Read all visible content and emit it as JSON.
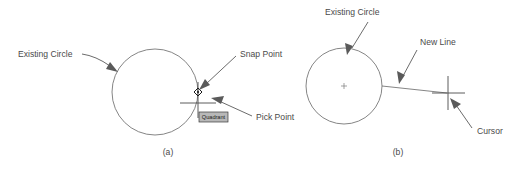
{
  "figure": {
    "background_color": "#ffffff",
    "line_color": "#666666",
    "text_color": "#4a4a4a",
    "tooltip_fill": "#b8b8b8"
  },
  "panel_a": {
    "caption": "(a)",
    "labels": {
      "existing_circle": "Existing Circle",
      "snap_point": "Snap Point",
      "pick_point": "Pick Point"
    },
    "tooltip": "Quadrant",
    "icons": {
      "snap_marker": "diamond-snap-marker-icon",
      "crosshair": "crosshair-cursor-icon"
    }
  },
  "panel_b": {
    "caption": "(b)",
    "labels": {
      "existing_circle": "Existing Circle",
      "new_line": "New Line",
      "cursor": "Cursor"
    },
    "icons": {
      "center_mark": "circle-center-mark-icon",
      "crosshair": "crosshair-cursor-icon"
    }
  }
}
